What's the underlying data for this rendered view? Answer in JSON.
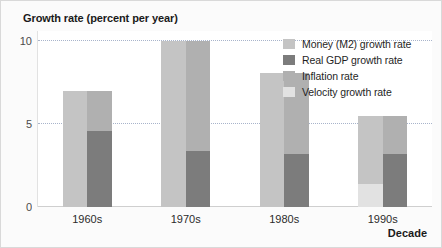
{
  "figure": {
    "background_color": "#fbfbfb",
    "border_color": "#d9d9d9",
    "plot_background": "#ffffff"
  },
  "chart_data": {
    "type": "bar",
    "title": "",
    "ylabel": "Growth rate (percent per year)",
    "xlabel": "Decade",
    "categories": [
      "1960s",
      "1970s",
      "1980s",
      "1990s"
    ],
    "ylim": [
      0,
      10.6
    ],
    "yticks": [
      0,
      5,
      10
    ],
    "ytick_labels": [
      "0",
      "5",
      "10"
    ],
    "grid": true,
    "grid_style": "dotted",
    "grid_color": "#9aa7c2",
    "legend_position": "upper right",
    "note": "Paired columns per decade. Left column = Money (M2) growth rate, optionally split with Velocity growth rate at its base. Right column = Real GDP growth rate at base plus Inflation rate stacked above; total of right column equals the left column total.",
    "series": [
      {
        "name": "Money (M2) growth rate",
        "color": "#c4c4c4",
        "column": "left",
        "values": [
          7.0,
          10.0,
          8.1,
          4.1
        ]
      },
      {
        "name": "Velocity growth rate",
        "color": "#e2e2e2",
        "column": "left",
        "values": [
          0.0,
          0.0,
          0.0,
          1.4
        ]
      },
      {
        "name": "Real GDP growth rate",
        "color": "#7c7c7c",
        "column": "right",
        "values": [
          4.6,
          3.4,
          3.2,
          3.2
        ]
      },
      {
        "name": "Inflation rate",
        "color": "#b0b0b0",
        "column": "right",
        "values": [
          2.4,
          6.6,
          4.9,
          2.3
        ]
      }
    ],
    "column_totals": {
      "left": [
        7.0,
        10.0,
        8.1,
        5.5
      ],
      "right": [
        7.0,
        10.0,
        8.1,
        5.5
      ]
    }
  },
  "legend": {
    "items": [
      {
        "label": "Money (M2) growth rate",
        "color": "#c4c4c4"
      },
      {
        "label": "Real GDP growth rate",
        "color": "#7c7c7c"
      },
      {
        "label": "Inflation rate",
        "color": "#b0b0b0"
      },
      {
        "label": "Velocity growth rate",
        "color": "#e2e2e2"
      }
    ]
  }
}
